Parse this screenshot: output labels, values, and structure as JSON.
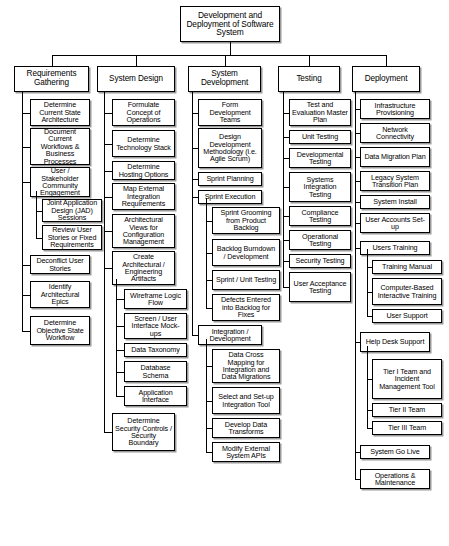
{
  "diagram": {
    "title": "Development and Deployment of Software System",
    "type": "work-breakdown-structure",
    "root": {
      "label": "Development and Deployment of Software System"
    },
    "columns": [
      {
        "id": "requirements-gathering",
        "header": "Requirements Gathering",
        "items": [
          {
            "label": "Determine Current State Architecture",
            "level": 2
          },
          {
            "label": "Document Current Workflows & Business Processes",
            "level": 2
          },
          {
            "label": "User / Stakeholder Community Engagement",
            "level": 2
          },
          {
            "label": "Joint Application Design (JAD) Sessions",
            "level": 3
          },
          {
            "label": "Review User Stories or Fixed Requirements",
            "level": 3
          },
          {
            "label": "Deconflict User Stories",
            "level": 2
          },
          {
            "label": "Identify Architectural Epics",
            "level": 2
          },
          {
            "label": "Determine Objective State Workflow",
            "level": 2
          }
        ]
      },
      {
        "id": "system-design",
        "header": "System Design",
        "items": [
          {
            "label": "Formulate Concept of Operations",
            "level": 2
          },
          {
            "label": "Determine Technology Stack",
            "level": 2
          },
          {
            "label": "Determine Hosting Options",
            "level": 2
          },
          {
            "label": "Map External Integration Requirements",
            "level": 2
          },
          {
            "label": "Architectural Views for Configuration Management",
            "level": 2
          },
          {
            "label": "Create Architectural / Engineering Artifacts",
            "level": 2
          },
          {
            "label": "Wireframe Logic Flow",
            "level": 3
          },
          {
            "label": "Screen / User Interface Mock-ups",
            "level": 3
          },
          {
            "label": "Data Taxonomy",
            "level": 3
          },
          {
            "label": "Database Schema",
            "level": 3
          },
          {
            "label": "Application Interface",
            "level": 3
          },
          {
            "label": "Determine Security Controls / Security Boundary",
            "level": 2
          }
        ]
      },
      {
        "id": "system-development",
        "header": "System Development",
        "items": [
          {
            "label": "Form Development Teams",
            "level": 2
          },
          {
            "label": "Design Development Methodology (i.e. Agile Scrum)",
            "level": 2
          },
          {
            "label": "Sprint Planning",
            "level": 2
          },
          {
            "label": "Sprint Execution",
            "level": 2
          },
          {
            "label": "Sprint Grooming from Product Backlog",
            "level": 3
          },
          {
            "label": "Backlog Burndown / Development",
            "level": 3
          },
          {
            "label": "Sprint / Unit Testing",
            "level": 3
          },
          {
            "label": "Defects Entered into Backlog for Fixes",
            "level": 3
          },
          {
            "label": "Integration / Development",
            "level": 2
          },
          {
            "label": "Data Cross Mapping for Integration and Data Migrations",
            "level": 3
          },
          {
            "label": "Select and Set-up Integration Tool",
            "level": 3
          },
          {
            "label": "Develop Data Transforms",
            "level": 3
          },
          {
            "label": "Modify External System APIs",
            "level": 3
          }
        ]
      },
      {
        "id": "testing",
        "header": "Testing",
        "items": [
          {
            "label": "Test and Evaluation Master Plan",
            "level": 2
          },
          {
            "label": "Unit Testing",
            "level": 2
          },
          {
            "label": "Developmental Testing",
            "level": 2
          },
          {
            "label": "Systems Integration Testing",
            "level": 2
          },
          {
            "label": "Compliance Testing",
            "level": 2
          },
          {
            "label": "Operational Testing",
            "level": 2
          },
          {
            "label": "Security Testing",
            "level": 2
          },
          {
            "label": "User Acceptance Testing",
            "level": 2
          }
        ]
      },
      {
        "id": "deployment",
        "header": "Deployment",
        "items": [
          {
            "label": "Infrastructure Provisioning",
            "level": 2
          },
          {
            "label": "Network Connectivity",
            "level": 2
          },
          {
            "label": "Data Migration Plan",
            "level": 2
          },
          {
            "label": "Legacy System Transition Plan",
            "level": 2
          },
          {
            "label": "System Install",
            "level": 2
          },
          {
            "label": "User Accounts Set-up",
            "level": 2
          },
          {
            "label": "Users Training",
            "level": 2
          },
          {
            "label": "Training Manual",
            "level": 3
          },
          {
            "label": "Computer-Based Interactive Training",
            "level": 3
          },
          {
            "label": "User Support",
            "level": 3
          },
          {
            "label": "Help Desk Support",
            "level": 2
          },
          {
            "label": "Tier I Team and Incident Management Tool",
            "level": 3
          },
          {
            "label": "Tier II Team",
            "level": 3
          },
          {
            "label": "Tier III Team",
            "level": 3
          },
          {
            "label": "System Go Live",
            "level": 2
          },
          {
            "label": "Operations & Maintenance",
            "level": 2
          }
        ]
      }
    ]
  }
}
